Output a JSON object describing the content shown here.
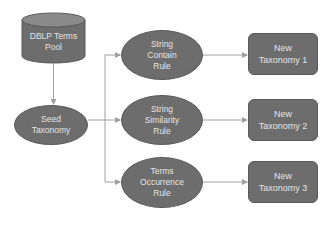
{
  "diagram": {
    "nodes": {
      "pool": {
        "label": "DBLP Terms\nPool",
        "shape": "cylinder"
      },
      "seed": {
        "label": "Seed\nTaxonomy",
        "shape": "ellipse"
      },
      "rule1": {
        "label": "String\nContain\nRule",
        "shape": "ellipse"
      },
      "rule2": {
        "label": "String\nSimilarity\nRule",
        "shape": "ellipse"
      },
      "rule3": {
        "label": "Terms\nOccurrence\nRule",
        "shape": "ellipse"
      },
      "tax1": {
        "label": "New\nTaxonomy 1",
        "shape": "rounded-rect"
      },
      "tax2": {
        "label": "New\nTaxonomy 2",
        "shape": "rounded-rect"
      },
      "tax3": {
        "label": "New\nTaxonomy 3",
        "shape": "rounded-rect"
      }
    },
    "edges": [
      {
        "from": "pool",
        "to": "seed"
      },
      {
        "from": "seed",
        "to": "rule1"
      },
      {
        "from": "seed",
        "to": "rule2"
      },
      {
        "from": "seed",
        "to": "rule3"
      },
      {
        "from": "rule1",
        "to": "tax1"
      },
      {
        "from": "rule2",
        "to": "tax2"
      },
      {
        "from": "rule3",
        "to": "tax3"
      }
    ],
    "colors": {
      "node_fill": "#6d6d6d",
      "node_text": "#e4e4e4",
      "edge": "#a0a0a0"
    }
  }
}
